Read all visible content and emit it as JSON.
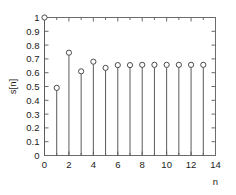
{
  "chart_data": {
    "type": "scatter",
    "plot_style": "stem",
    "title": "",
    "xlabel": "n",
    "ylabel": "s[n]",
    "x": [
      0,
      1,
      2,
      3,
      4,
      5,
      6,
      7,
      8,
      9,
      10,
      11,
      12,
      13
    ],
    "values": [
      1.0,
      0.49,
      0.745,
      0.61,
      0.68,
      0.635,
      0.655,
      0.655,
      0.657,
      0.657,
      0.657,
      0.657,
      0.657,
      0.657
    ],
    "series": [
      {
        "name": "s[n]",
        "values": [
          1.0,
          0.49,
          0.745,
          0.61,
          0.68,
          0.635,
          0.655,
          0.655,
          0.657,
          0.657,
          0.657,
          0.657,
          0.657,
          0.657
        ]
      }
    ],
    "xlim": [
      0,
      14
    ],
    "ylim": [
      0,
      1
    ],
    "xticks": [
      0,
      2,
      4,
      6,
      8,
      10,
      12,
      14
    ],
    "xtick_labels": [
      "0",
      "2",
      "4",
      "6",
      "8",
      "10",
      "12",
      "14"
    ],
    "xminor_ticks": [
      1,
      3,
      5,
      7,
      9,
      11,
      13
    ],
    "yticks": [
      0,
      0.1,
      0.2,
      0.3,
      0.4,
      0.5,
      0.6,
      0.7,
      0.8,
      0.9,
      1.0
    ],
    "ytick_labels": [
      "0",
      "0.1",
      "0.2",
      "0.3",
      "0.4",
      "0.5",
      "0.6",
      "0.7",
      "0.8",
      "0.9",
      "1"
    ],
    "grid": false,
    "legend": null,
    "legend_position": "none",
    "colors": {
      "axis": "#6b6b6b",
      "stem": "#5a5a5a",
      "marker_edge": "#4a4a4a",
      "marker_face": "#ffffff",
      "text": "#1a1a1a",
      "background": "#ffffff"
    },
    "marker": "circle-open"
  }
}
